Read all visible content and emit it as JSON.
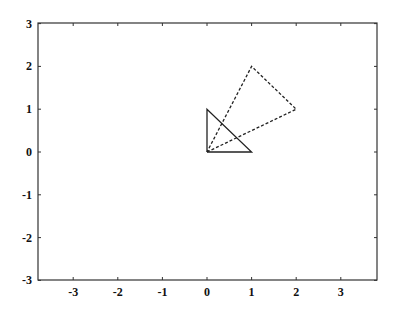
{
  "chart_data": {
    "type": "line",
    "title": "",
    "xlabel": "",
    "ylabel": "",
    "xlim": [
      -3.8,
      3.8
    ],
    "ylim": [
      -3,
      3
    ],
    "grid": false,
    "x_ticks": [
      "-3",
      "-2",
      "-1",
      "0",
      "1",
      "2",
      "3"
    ],
    "y_ticks": [
      "3",
      "2",
      "1",
      "0",
      "-1",
      "-2",
      "-3"
    ],
    "series": [
      {
        "name": "original triangle",
        "style": "solid",
        "points": [
          [
            0,
            0
          ],
          [
            1,
            0
          ],
          [
            0,
            1
          ],
          [
            0,
            0
          ]
        ]
      },
      {
        "name": "transformed triangle",
        "style": "dashed",
        "points": [
          [
            0,
            0
          ],
          [
            2,
            1
          ],
          [
            1,
            2
          ],
          [
            0,
            0
          ]
        ]
      }
    ]
  },
  "colors": {
    "axis": "#333333",
    "line": "#222222",
    "background": "#ffffff"
  }
}
